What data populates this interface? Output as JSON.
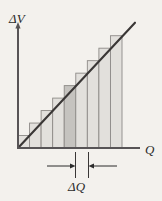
{
  "figure": {
    "background_color": "#f3f1ed",
    "width": 162,
    "height": 201
  },
  "axes": {
    "y_label": "ΔV",
    "x_label": "Q",
    "axis_color": "#555253",
    "origin": {
      "x": 18,
      "y": 148
    },
    "y_top": 24,
    "x_right": 140
  },
  "annotation": {
    "label": "ΔQ",
    "description": "double-headed dimension arrow marking one bar width",
    "tick_left_x": 75,
    "tick_right_x": 88,
    "arrow_y": 166,
    "tick_top_y": 152,
    "tick_bottom_y": 178,
    "color": "#2b2b2b"
  },
  "chart_data": {
    "type": "bar",
    "title": "",
    "xlabel": "Q",
    "ylabel": "ΔV",
    "grid": false,
    "legend": null,
    "bar_count": 9,
    "bar_fill": "#e2e0dc",
    "bar_stroke": "#8d8a87",
    "highlight_index": 4,
    "highlight_fill": "#c5c3bf",
    "categories": [
      1,
      2,
      3,
      4,
      5,
      6,
      7,
      8,
      9
    ],
    "values": [
      13,
      26,
      39,
      52,
      65,
      78,
      91,
      104,
      117
    ],
    "xlim": [
      0,
      122
    ],
    "ylim": [
      0,
      124
    ],
    "series": [
      {
        "name": "staircase-bars",
        "type": "bar",
        "values": [
          13,
          26,
          39,
          52,
          65,
          78,
          91,
          104,
          117
        ]
      },
      {
        "name": "linear-trend",
        "type": "line",
        "color": "#3a3736",
        "x": [
          0,
          112
        ],
        "y": [
          0,
          118
        ]
      }
    ]
  }
}
